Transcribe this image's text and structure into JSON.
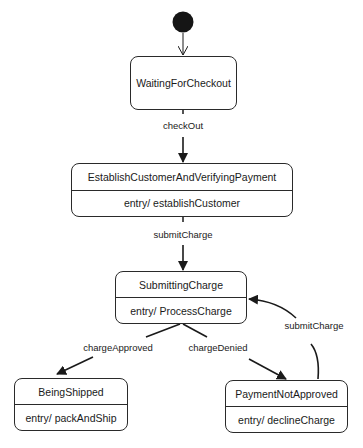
{
  "diagram": {
    "type": "uml-state-machine",
    "initial_state": "WaitingForCheckout",
    "states": [
      {
        "id": "waiting",
        "name": "WaitingForCheckout",
        "action": null
      },
      {
        "id": "establish",
        "name": "EstablishCustomerAndVerifyingPayment",
        "action": "entry/ establishCustomer"
      },
      {
        "id": "submitting",
        "name": "SubmittingCharge",
        "action": "entry/ ProcessCharge"
      },
      {
        "id": "shipped",
        "name": "BeingShipped",
        "action": "entry/ packAndShip"
      },
      {
        "id": "notapproved",
        "name": "PaymentNotApproved",
        "action": "entry/ declineCharge"
      }
    ],
    "transitions": [
      {
        "from": "initial",
        "to": "waiting",
        "label": ""
      },
      {
        "from": "waiting",
        "to": "establish",
        "label": "checkOut"
      },
      {
        "from": "establish",
        "to": "submitting",
        "label": "submitCharge"
      },
      {
        "from": "submitting",
        "to": "shipped",
        "label": "chargeApproved"
      },
      {
        "from": "submitting",
        "to": "notapproved",
        "label": "chargeDenied"
      },
      {
        "from": "notapproved",
        "to": "submitting",
        "label": "submitCharge"
      }
    ]
  },
  "colors": {
    "line": "#2a2a2a",
    "background": "#ffffff"
  }
}
